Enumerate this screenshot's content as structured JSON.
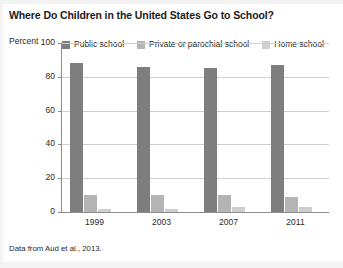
{
  "figure": {
    "title": "Where Do Children in the United States Go to School?",
    "source_note": "Data from Aud et al., 2013.",
    "axis_label_y": "Percent"
  },
  "colors": {
    "public_school": "#7e7e7e",
    "private_school": "#b4b4b4",
    "home_school": "#cfcfcf",
    "axis": "#8c8c8c",
    "gridline": "#d0d0d0",
    "text": "#1f1f1f",
    "background": "#ffffff"
  },
  "chart_data": {
    "type": "bar",
    "title": "Where Do Children in the United States Go to School?",
    "xlabel": "",
    "ylabel": "Percent",
    "ylim": [
      0,
      100
    ],
    "yticks": [
      0,
      20,
      40,
      60,
      80,
      100
    ],
    "ytick_labels": [
      "0",
      "20",
      "40",
      "60",
      "80",
      "100"
    ],
    "categories": [
      "1999",
      "2003",
      "2007",
      "2011"
    ],
    "grid": true,
    "legend_position": "top",
    "series": [
      {
        "name": "Public school",
        "color": "#7e7e7e",
        "values": [
          88,
          86,
          85,
          87
        ]
      },
      {
        "name": "Private or parochial school",
        "color": "#b4b4b4",
        "values": [
          10,
          10,
          10,
          9
        ]
      },
      {
        "name": "Home school",
        "color": "#cfcfcf",
        "values": [
          2,
          2,
          3,
          3
        ]
      }
    ]
  }
}
